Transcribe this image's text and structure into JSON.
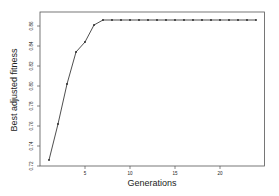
{
  "chart_data": {
    "type": "line",
    "title": "",
    "xlabel": "Generations",
    "ylabel": "Best adjusted fitness",
    "x": [
      1,
      2,
      3,
      4,
      5,
      6,
      7,
      8,
      9,
      10,
      11,
      12,
      13,
      14,
      15,
      16,
      17,
      18,
      19,
      20,
      21,
      22,
      23,
      24
    ],
    "series": [
      {
        "name": "Best adjusted fitness",
        "values": [
          0.726,
          0.762,
          0.802,
          0.834,
          0.844,
          0.861,
          0.866,
          0.866,
          0.866,
          0.866,
          0.866,
          0.866,
          0.866,
          0.866,
          0.866,
          0.866,
          0.866,
          0.866,
          0.866,
          0.866,
          0.866,
          0.866,
          0.866,
          0.866
        ],
        "marker": "point",
        "color": "#222222"
      }
    ],
    "xticks": [
      5,
      10,
      15,
      20
    ],
    "xtick_labels": [
      "5",
      "10",
      "15",
      "20"
    ],
    "yticks": [
      0.72,
      0.74,
      0.76,
      0.78,
      0.8,
      0.82,
      0.84,
      0.86
    ],
    "ytick_labels": [
      "0.72",
      "0.74",
      "0.76",
      "0.78",
      "0.80",
      "0.82",
      "0.84",
      "0.86"
    ],
    "xlim": [
      0.1,
      25.0
    ],
    "ylim": [
      0.72,
      0.8754
    ],
    "grid": false,
    "legend": "none",
    "frame": "box"
  }
}
